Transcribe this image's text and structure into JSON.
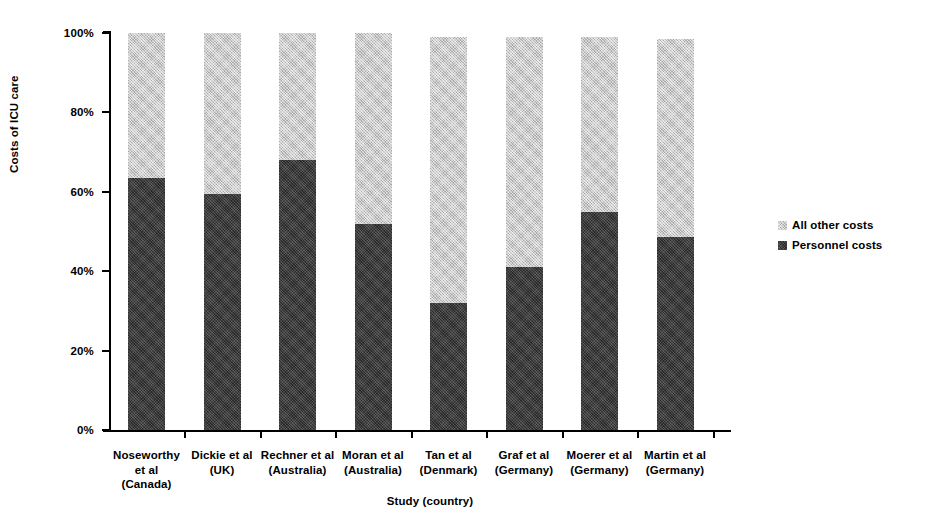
{
  "chart_data": {
    "type": "bar",
    "subtype": "stacked-bar-100-percent",
    "title": "",
    "xlabel": "Study (country)",
    "ylabel": "Costs of ICU care",
    "ylim": [
      0,
      100
    ],
    "ytick_labels": [
      "100%",
      "80%",
      "60%",
      "40%",
      "20%",
      "0%"
    ],
    "ytick_values": [
      100,
      80,
      60,
      40,
      20,
      0
    ],
    "grid": false,
    "legend_position": "right",
    "categories": [
      "Noseworthy et al (Canada)",
      "Dickie et al (UK)",
      "Rechner et al (Australia)",
      "Moran et al (Australia)",
      "Tan et al (Denmark)",
      "Graf et al (Germany)",
      "Moerer et al (Germany)",
      "Martin et al (Germany)"
    ],
    "category_lines": [
      [
        "Noseworthy",
        "et al",
        "(Canada)"
      ],
      [
        "Dickie et al",
        "(UK)"
      ],
      [
        "Rechner et al",
        "(Australia)"
      ],
      [
        "Moran et al",
        "(Australia)"
      ],
      [
        "Tan et al",
        "(Denmark)"
      ],
      [
        "Graf et al",
        "(Germany)"
      ],
      [
        "Moerer et al",
        "(Germany)"
      ],
      [
        "Martin et al",
        "(Germany)"
      ]
    ],
    "series": [
      {
        "name": "Personnel costs",
        "color": "#3a3a3a",
        "values": [
          63.5,
          59.5,
          68.0,
          52.0,
          32.0,
          41.0,
          55.0,
          48.5
        ]
      },
      {
        "name": "All other costs",
        "color": "#bfbfbf",
        "values": [
          36.5,
          40.5,
          32.0,
          48.0,
          67.0,
          58.0,
          44.0,
          50.0
        ]
      }
    ],
    "bar_totals": [
      100.0,
      100.0,
      100.0,
      100.0,
      99.0,
      99.0,
      99.0,
      98.5
    ]
  },
  "axes": {
    "y_title": "Costs of ICU care",
    "x_title": "Study (country)"
  },
  "legend": {
    "entries": [
      {
        "label": "All other costs",
        "color": "#bfbfbf"
      },
      {
        "label": "Personnel costs",
        "color": "#3a3a3a"
      }
    ]
  }
}
